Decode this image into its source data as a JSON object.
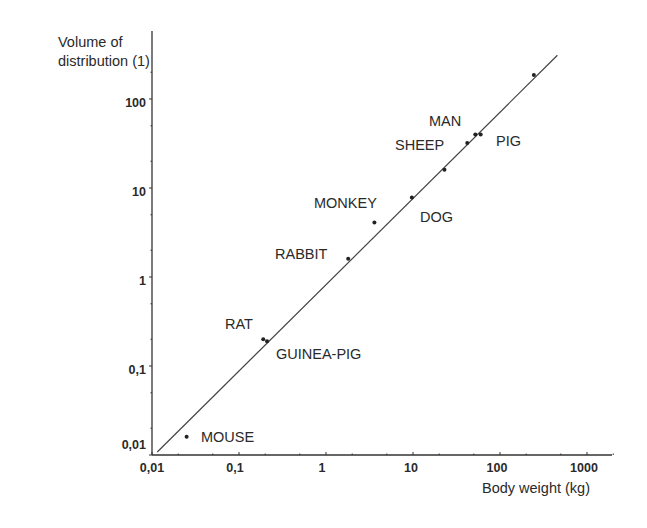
{
  "chart_data": {
    "type": "scatter",
    "title": "",
    "xlabel": "Body weight (kg)",
    "ylabel": "Volume of distribution (1)",
    "xscale": "log",
    "yscale": "log",
    "xlim": [
      0.01,
      2000
    ],
    "ylim": [
      0.01,
      500
    ],
    "grid": false,
    "legend": null,
    "x_ticks": [
      {
        "value": 0.01,
        "label": "0,01"
      },
      {
        "value": 0.1,
        "label": "0,1"
      },
      {
        "value": 1,
        "label": "1"
      },
      {
        "value": 10,
        "label": "10"
      },
      {
        "value": 100,
        "label": "100"
      },
      {
        "value": 1000,
        "label": "1000"
      }
    ],
    "y_ticks": [
      {
        "value": 0.01,
        "label": "0,01"
      },
      {
        "value": 0.1,
        "label": "0,1"
      },
      {
        "value": 1,
        "label": "1"
      },
      {
        "value": 10,
        "label": "10"
      },
      {
        "value": 100,
        "label": "100"
      }
    ],
    "points": [
      {
        "label": "MOUSE",
        "x": 0.025,
        "y": 0.016
      },
      {
        "label": "RAT",
        "x": 0.19,
        "y": 0.2
      },
      {
        "label": "GUINEA-PIG",
        "x": 0.21,
        "y": 0.19
      },
      {
        "label": "RABBIT",
        "x": 1.8,
        "y": 1.6
      },
      {
        "label": "MONKEY",
        "x": 3.6,
        "y": 4.1
      },
      {
        "label": "DOG",
        "x": 9.7,
        "y": 7.8
      },
      {
        "label": "",
        "x": 23,
        "y": 16
      },
      {
        "label": "SHEEP",
        "x": 42,
        "y": 32
      },
      {
        "label": "MAN",
        "x": 52,
        "y": 40
      },
      {
        "label": "PIG",
        "x": 60,
        "y": 40
      },
      {
        "label": "",
        "x": 245,
        "y": 186
      }
    ],
    "fit_line": {
      "x": [
        0.0115,
        457
      ],
      "y": [
        0.0108,
        310
      ]
    }
  },
  "labels": {
    "ylabel_line1": "Volume of",
    "ylabel_line2": "distribution (1)",
    "xlabel": "Body weight (kg)",
    "x_ticks": [
      "0,01",
      "0,1",
      "1",
      "10",
      "100",
      "1000"
    ],
    "y_ticks": [
      "0,01",
      "0,1",
      "1",
      "10",
      "100"
    ],
    "points": {
      "mouse": "MOUSE",
      "rat": "RAT",
      "guinea_pig": "GUINEA-PIG",
      "rabbit": "RABBIT",
      "monkey": "MONKEY",
      "dog": "DOG",
      "sheep": "SHEEP",
      "man": "MAN",
      "pig": "PIG"
    }
  }
}
